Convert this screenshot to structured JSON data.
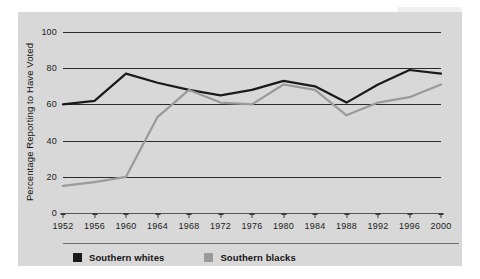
{
  "chart_data": {
    "type": "line",
    "title": "",
    "xlabel": "",
    "ylabel": "Percentage Reporting to Have Voted",
    "categories": [
      1952,
      1956,
      1960,
      1964,
      1968,
      1972,
      1976,
      1980,
      1984,
      1988,
      1992,
      1996,
      2000
    ],
    "xtick_labels": [
      "1952",
      "1956",
      "1960",
      "1964",
      "1968",
      "1972",
      "1976",
      "1980",
      "1984",
      "1988",
      "1992",
      "1996",
      "2000"
    ],
    "ytick_labels": [
      "0",
      "20",
      "40",
      "60",
      "80",
      "100"
    ],
    "yticks": [
      0,
      20,
      40,
      60,
      80,
      100
    ],
    "ylim": [
      0,
      100
    ],
    "grid": true,
    "legend_position": "bottom-left",
    "series": [
      {
        "name": "Southern whites",
        "color": "#1a1a1a",
        "values": [
          60,
          62,
          77,
          72,
          68,
          65,
          68,
          73,
          70,
          61,
          71,
          79,
          77
        ]
      },
      {
        "name": "Southern blacks",
        "color": "#9a9a9a",
        "values": [
          15,
          17,
          20,
          53,
          68,
          61,
          60,
          71,
          68,
          54,
          61,
          64,
          71
        ]
      }
    ]
  },
  "legend": {
    "entries": [
      {
        "label": "Southern whites",
        "color": "#1a1a1a"
      },
      {
        "label": "Southern blacks",
        "color": "#9a9a9a"
      }
    ]
  },
  "colors": {
    "panel_background": "#d8d8d8",
    "page_background": "#ffffff",
    "gridline": "#2b2b2b",
    "axis": "#555555",
    "text": "#1c1c1c",
    "southern_whites": "#1a1a1a",
    "southern_blacks": "#9a9a9a"
  }
}
